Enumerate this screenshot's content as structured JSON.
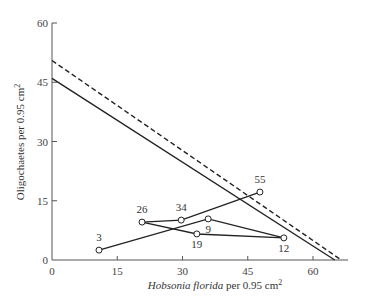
{
  "chart_data": {
    "type": "scatter",
    "title": "",
    "xlabel_italic": "Hobsonia florida",
    "xlabel_rest": " per 0.95 cm",
    "xlabel_sup": "2",
    "ylabel": "Oligochaetes per 0.95 cm",
    "ylabel_sup": "2",
    "xlim": [
      0,
      70
    ],
    "ylim": [
      0,
      60
    ],
    "x_ticks": [
      0,
      15,
      30,
      45,
      60
    ],
    "y_ticks": [
      0,
      15,
      30,
      45,
      60
    ],
    "grid": false,
    "lines": [
      {
        "name": "solid-isocline",
        "style": "solid",
        "points": [
          [
            0,
            46
          ],
          [
            65,
            0
          ]
        ]
      },
      {
        "name": "dashed-isocline",
        "style": "dashed",
        "points": [
          [
            0,
            50.5
          ],
          [
            66.5,
            0
          ]
        ]
      }
    ],
    "points": [
      {
        "label": "3",
        "x": 10.8,
        "y": 2.5
      },
      {
        "label": "26",
        "x": 20.7,
        "y": 9.6
      },
      {
        "label": "34",
        "x": 29.7,
        "y": 10.1
      },
      {
        "label": "55",
        "x": 47.8,
        "y": 17.2
      },
      {
        "label": "9",
        "x": 35.9,
        "y": 10.4
      },
      {
        "label": "19",
        "x": 33.3,
        "y": 6.6
      },
      {
        "label": "12",
        "x": 53.3,
        "y": 5.6
      }
    ],
    "trajectories": [
      [
        "3",
        "9",
        "12"
      ],
      [
        "26",
        "34",
        "55"
      ],
      [
        "26",
        "19",
        "12"
      ]
    ]
  }
}
